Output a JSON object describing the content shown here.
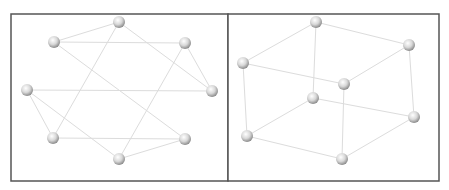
{
  "figure": {
    "node_style": {
      "fill_light": "#ffffff",
      "fill_dark": "#9a9a9a",
      "radius": 6
    },
    "edge_color": "#dcdcdc",
    "frame_color": "#555555"
  },
  "panels": [
    {
      "name": "circular-layout",
      "frame": {
        "x": 11,
        "y": 14,
        "w": 217,
        "h": 167
      },
      "nodes": [
        {
          "id": "top",
          "x": 119,
          "y": 22
        },
        {
          "id": "upper-left",
          "x": 54,
          "y": 42
        },
        {
          "id": "upper-right",
          "x": 185,
          "y": 43
        },
        {
          "id": "left",
          "x": 27,
          "y": 90
        },
        {
          "id": "right",
          "x": 212,
          "y": 91
        },
        {
          "id": "lower-left",
          "x": 53,
          "y": 138
        },
        {
          "id": "lower-right",
          "x": 185,
          "y": 139
        },
        {
          "id": "bottom",
          "x": 119,
          "y": 159
        }
      ],
      "edges": [
        [
          "top",
          "upper-left"
        ],
        [
          "top",
          "lower-left"
        ],
        [
          "top",
          "right"
        ],
        [
          "upper-left",
          "upper-right"
        ],
        [
          "upper-left",
          "lower-right"
        ],
        [
          "upper-right",
          "right"
        ],
        [
          "upper-right",
          "bottom"
        ],
        [
          "left",
          "right"
        ],
        [
          "left",
          "lower-left"
        ],
        [
          "left",
          "bottom"
        ],
        [
          "lower-left",
          "lower-right"
        ],
        [
          "lower-right",
          "bottom"
        ]
      ]
    },
    {
      "name": "cube-layout",
      "frame": {
        "x": 228,
        "y": 14,
        "w": 211,
        "h": 167
      },
      "nodes": [
        {
          "id": "top-back",
          "x": 316,
          "y": 22
        },
        {
          "id": "right-back",
          "x": 409,
          "y": 45
        },
        {
          "id": "left-top",
          "x": 243,
          "y": 63
        },
        {
          "id": "front-top",
          "x": 344,
          "y": 84
        },
        {
          "id": "inner",
          "x": 313,
          "y": 98
        },
        {
          "id": "right-bottom",
          "x": 414,
          "y": 117
        },
        {
          "id": "left-bottom",
          "x": 247,
          "y": 136
        },
        {
          "id": "front-bottom",
          "x": 342,
          "y": 159
        }
      ],
      "edges": [
        [
          "top-back",
          "left-top"
        ],
        [
          "top-back",
          "right-back"
        ],
        [
          "top-back",
          "inner"
        ],
        [
          "left-top",
          "front-top"
        ],
        [
          "front-top",
          "right-back"
        ],
        [
          "left-top",
          "left-bottom"
        ],
        [
          "front-top",
          "front-bottom"
        ],
        [
          "right-back",
          "right-bottom"
        ],
        [
          "inner",
          "left-bottom"
        ],
        [
          "inner",
          "right-bottom"
        ],
        [
          "left-bottom",
          "front-bottom"
        ],
        [
          "front-bottom",
          "right-bottom"
        ]
      ]
    }
  ]
}
